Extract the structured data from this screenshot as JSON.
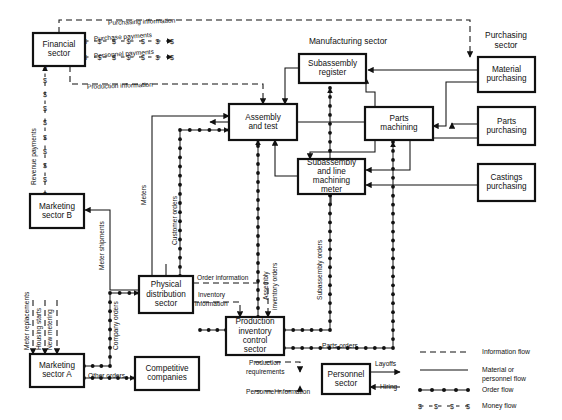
{
  "diagram": {
    "group_labels": [
      {
        "id": "manufacturing",
        "text": "Manufacturing sector",
        "x": 348,
        "y": 44
      },
      {
        "id": "purchasing",
        "text": "Purchasing",
        "x": 506,
        "y": 38
      },
      {
        "id": "purchasing2",
        "text": "sector",
        "x": 506,
        "y": 48
      }
    ],
    "nodes": [
      {
        "id": "financial",
        "label": [
          "Financial",
          "sector"
        ],
        "x": 33,
        "y": 33,
        "w": 52,
        "h": 33
      },
      {
        "id": "marketing_b",
        "label": [
          "Marketing",
          "sector B"
        ],
        "x": 30,
        "y": 194,
        "w": 54,
        "h": 34
      },
      {
        "id": "marketing_a",
        "label": [
          "Marketing",
          "sector A"
        ],
        "x": 30,
        "y": 354,
        "w": 54,
        "h": 33
      },
      {
        "id": "competitive",
        "label": [
          "Competitive",
          "companies"
        ],
        "x": 135,
        "y": 357,
        "w": 64,
        "h": 33
      },
      {
        "id": "physical_dist",
        "label": [
          "Physical",
          "distribution",
          "sector"
        ],
        "x": 139,
        "y": 276,
        "w": 54,
        "h": 37
      },
      {
        "id": "prod_inv_ctrl",
        "label": [
          "Production",
          "inventory",
          "control",
          "sector"
        ],
        "x": 226,
        "y": 317,
        "w": 58,
        "h": 38
      },
      {
        "id": "assembly_test",
        "label": [
          "Assembly",
          "and test"
        ],
        "x": 229,
        "y": 104,
        "w": 68,
        "h": 36
      },
      {
        "id": "subassembly_reg",
        "label": [
          "Subassembly",
          "register"
        ],
        "x": 299,
        "y": 54,
        "w": 67,
        "h": 29
      },
      {
        "id": "subassembly_line",
        "label": [
          "Subassembly",
          "and line",
          "machining",
          "meter"
        ],
        "x": 298,
        "y": 159,
        "w": 67,
        "h": 35
      },
      {
        "id": "parts_machining",
        "label": [
          "Parts",
          "machining"
        ],
        "x": 365,
        "y": 107,
        "w": 68,
        "h": 33
      },
      {
        "id": "material_purch",
        "label": [
          "Material",
          "purchasing"
        ],
        "x": 478,
        "y": 57,
        "w": 57,
        "h": 35
      },
      {
        "id": "parts_purch",
        "label": [
          "Parts",
          "purchasing"
        ],
        "x": 478,
        "y": 107,
        "w": 57,
        "h": 38
      },
      {
        "id": "castings_purch",
        "label": [
          "Castings",
          "purchasing"
        ],
        "x": 478,
        "y": 164,
        "w": 57,
        "h": 37
      },
      {
        "id": "personnel",
        "label": [
          "Personnel",
          "sector"
        ],
        "x": 322,
        "y": 364,
        "w": 48,
        "h": 30
      }
    ],
    "edge_labels": [
      {
        "id": "purchase-payments",
        "text": "Purchase payments",
        "x": 94,
        "y": 41,
        "rotate": -4
      },
      {
        "id": "personnel-payments",
        "text": "Personnel payments",
        "x": 94,
        "y": 58,
        "rotate": -4
      },
      {
        "id": "purchasing-information",
        "text": "Purchasing information",
        "x": 108,
        "y": 25,
        "rotate": -2
      },
      {
        "id": "production-information",
        "text": "Production information",
        "x": 87,
        "y": 89,
        "rotate": -2
      },
      {
        "id": "revenue-payments",
        "text": "Revenue payments",
        "x": 36,
        "y": 185,
        "rotate": -90
      },
      {
        "id": "meters",
        "text": "Meters",
        "x": 146,
        "y": 205,
        "rotate": -90
      },
      {
        "id": "customer-orders",
        "text": "Customer orders",
        "x": 177,
        "y": 245,
        "rotate": -90
      },
      {
        "id": "meter-shipments",
        "text": "Meter shipments",
        "x": 104,
        "y": 270,
        "rotate": -90
      },
      {
        "id": "meter-replacements",
        "text": "Meter replacements",
        "x": 29,
        "y": 350,
        "rotate": -90
      },
      {
        "id": "housing-starts",
        "text": "Housing starts",
        "x": 41,
        "y": 350,
        "rotate": -90
      },
      {
        "id": "new-metering",
        "text": "New metering",
        "x": 52,
        "y": 350,
        "rotate": -90
      },
      {
        "id": "company-orders",
        "text": "Company orders",
        "x": 118,
        "y": 350,
        "rotate": -90
      },
      {
        "id": "other-orders",
        "text": "Other orders",
        "x": 88,
        "y": 378,
        "rotate": 0
      },
      {
        "id": "order-information",
        "text": "Order information",
        "x": 197,
        "y": 280,
        "rotate": 0
      },
      {
        "id": "inventory-1",
        "text": "Inventory",
        "x": 198,
        "y": 297,
        "rotate": 0
      },
      {
        "id": "inventory-2",
        "text": "information",
        "x": 195,
        "y": 306,
        "rotate": 0
      },
      {
        "id": "assembly-inv-1",
        "text": "Assembly",
        "x": 268,
        "y": 300,
        "rotate": -90
      },
      {
        "id": "assembly-inv-2",
        "text": "inventory orders",
        "x": 277,
        "y": 310,
        "rotate": -90
      },
      {
        "id": "subassembly-orders",
        "text": "Subassembly orders",
        "x": 322,
        "y": 300,
        "rotate": -90
      },
      {
        "id": "parts-orders",
        "text": "Parts orders",
        "x": 322,
        "y": 348,
        "rotate": 0
      },
      {
        "id": "production-req-1",
        "text": "Production",
        "x": 249,
        "y": 365,
        "rotate": 0
      },
      {
        "id": "production-req-2",
        "text": "requirements",
        "x": 246,
        "y": 374,
        "rotate": 0
      },
      {
        "id": "personnel-information",
        "text": "Personnel information",
        "x": 246,
        "y": 394,
        "rotate": 0
      },
      {
        "id": "layoffs",
        "text": "Layoffs",
        "x": 375,
        "y": 366,
        "rotate": 0
      },
      {
        "id": "hiring",
        "text": "Hiring",
        "x": 380,
        "y": 389,
        "rotate": 0
      }
    ],
    "legend": {
      "items": [
        {
          "id": "information-flow",
          "label": "Information flow",
          "style": "dashed"
        },
        {
          "id": "material-flow-1",
          "label": "Material or",
          "style": "solid"
        },
        {
          "id": "material-flow-2",
          "label": "personnel flow",
          "style": "none"
        },
        {
          "id": "order-flow",
          "label": "Order flow",
          "style": "order"
        },
        {
          "id": "money-flow",
          "label": "Money flow",
          "style": "money"
        }
      ],
      "x": 420,
      "y": 352
    },
    "colors": {
      "line": "#111111",
      "box_fill": "#ffffff",
      "background": "#ffffff"
    }
  }
}
